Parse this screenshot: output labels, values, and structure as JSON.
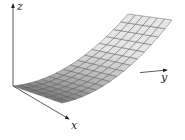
{
  "diagram": {
    "type": "3d-surface",
    "axes": {
      "x": {
        "label": "x"
      },
      "y": {
        "label": "y"
      },
      "z": {
        "label": "z"
      }
    },
    "grid": {
      "x_divisions": 6,
      "y_divisions": 16
    },
    "colors": {
      "axis": "#333333",
      "mesh_line": "#555555",
      "surface_light": "#e6e6e6",
      "surface_dark": "#6e6e6e"
    }
  },
  "projection": {
    "origin": [
      13,
      86
    ],
    "x_end_base": [
      62,
      103
    ],
    "y_end_base_at_x0": [
      128,
      74
    ],
    "y_end_base_at_x1": [
      172,
      80
    ],
    "z_lift": 60,
    "z_axis_top": [
      13,
      4
    ],
    "x_axis_tip": [
      69,
      119
    ],
    "y_axis_tip": [
      167,
      70
    ],
    "label_pos": {
      "x": [
        71,
        129
      ],
      "y": [
        161,
        81
      ],
      "z": [
        17,
        10
      ]
    }
  }
}
